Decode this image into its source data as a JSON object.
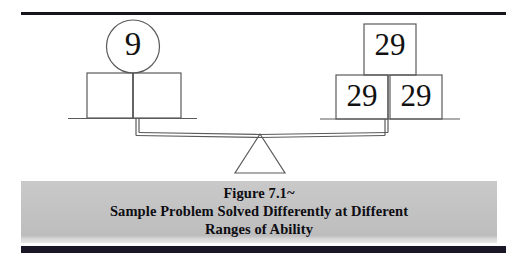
{
  "figure": {
    "background_color": "#ffffff",
    "rule_color": "#16161c",
    "bottom_bar_color": "#1a1625",
    "caption_band_color": "#c3c3c3",
    "line_color": "#5a5a5a",
    "text_color": "#111111"
  },
  "diagram": {
    "type": "balance-scale",
    "left_pan": {
      "label": "left-pan",
      "circle_value": "9",
      "boxes": [
        "",
        ""
      ]
    },
    "right_pan": {
      "label": "right-pan",
      "boxes": [
        "29",
        "29",
        "29"
      ],
      "top_box_value": "29",
      "bottom_left_box_value": "29",
      "bottom_right_box_value": "29"
    },
    "fulcrum": "triangle"
  },
  "caption": {
    "line1": "Figure 7.1~",
    "line2": "Sample Problem Solved Differently at Different",
    "line3": "Ranges of Ability"
  }
}
